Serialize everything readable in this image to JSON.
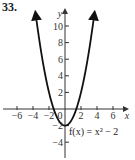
{
  "problem_number": "33.",
  "chart_data": {
    "type": "line",
    "title": "",
    "function": "f(x) = x^2 - 2",
    "function_label": "f(x) = x² − 2",
    "xlabel": "x",
    "ylabel": "y",
    "xlim": [
      -7,
      7
    ],
    "ylim": [
      -5.5,
      12
    ],
    "x_ticks": [
      -6,
      -4,
      -2,
      0,
      2,
      4,
      6
    ],
    "x_tick_labels": [
      "−6",
      "−4",
      "−2",
      "0",
      "2",
      "4",
      "6"
    ],
    "y_ticks": [
      -4,
      -2,
      2,
      4,
      6,
      8,
      10
    ],
    "y_tick_labels": [
      "−4",
      "−2",
      "2",
      "4",
      "6",
      "8",
      "10"
    ],
    "grid": false,
    "arrows": true,
    "series": [
      {
        "name": "f(x) = x^2 - 2",
        "x": [
          -3.6,
          -3,
          -2,
          -1.414,
          -1,
          0,
          1,
          1.414,
          2,
          3,
          3.6
        ],
        "y": [
          10.96,
          7,
          2,
          0,
          -1,
          -2,
          -1,
          0,
          2,
          7,
          10.96
        ]
      }
    ],
    "colors": {
      "curve": "#111111",
      "axes": "#333333"
    }
  }
}
